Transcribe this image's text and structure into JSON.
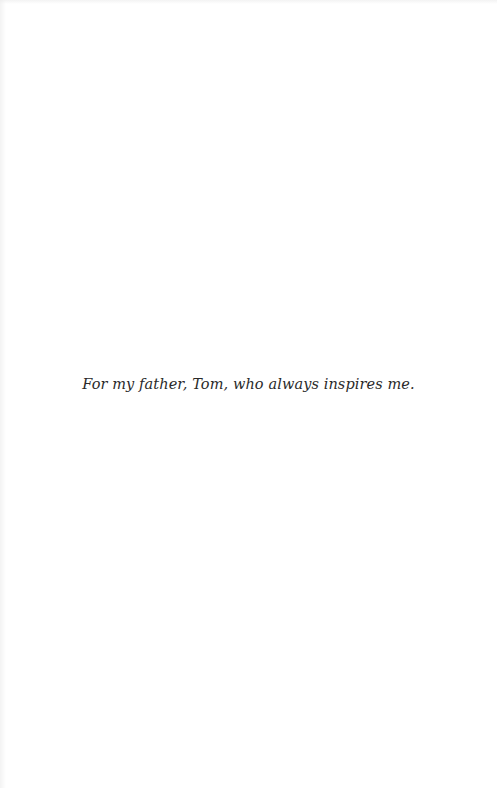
{
  "page": {
    "background_color": "#ffffff",
    "text_color": "#2a2a2a"
  },
  "dedication": {
    "text": "For my father, Tom, who always inspires me."
  }
}
